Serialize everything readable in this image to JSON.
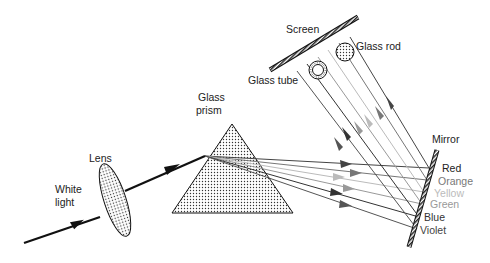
{
  "diagram": {
    "labels": {
      "white_light_line1": "White",
      "white_light_line2": "light",
      "lens": "Lens",
      "glass_prism_line1": "Glass",
      "glass_prism_line2": "prism",
      "screen": "Screen",
      "glass_rod": "Glass rod",
      "glass_tube": "Glass tube",
      "mirror": "Mirror"
    },
    "spectrum": [
      {
        "name": "Red",
        "color": "#444444"
      },
      {
        "name": "Orange",
        "color": "#777777"
      },
      {
        "name": "Yellow",
        "color": "#bbbbbb"
      },
      {
        "name": "Green",
        "color": "#999999"
      },
      {
        "name": "Blue",
        "color": "#333333"
      },
      {
        "name": "Violet",
        "color": "#555555"
      }
    ]
  }
}
